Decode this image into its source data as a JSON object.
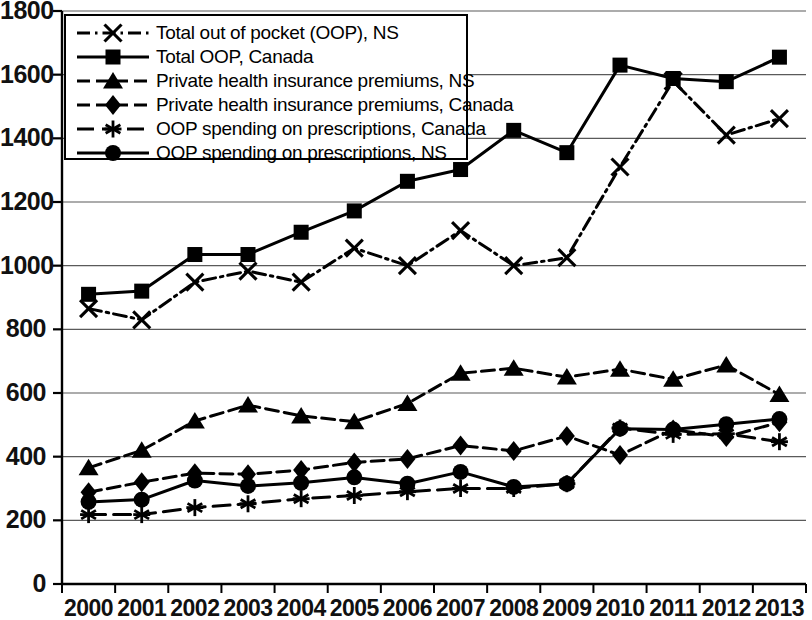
{
  "chart_data": {
    "type": "line",
    "title": "",
    "xlabel": "",
    "ylabel": "",
    "ylim": [
      0,
      1800
    ],
    "ytick_step": 200,
    "yticks": [
      "0",
      "200",
      "400",
      "600",
      "800",
      "1000",
      "1200",
      "1400",
      "1600",
      "1800"
    ],
    "grid": true,
    "grid_axis": "y",
    "legend_position": "top-left-inside",
    "color": "#000000",
    "categories": [
      "2000",
      "2001",
      "2002",
      "2003",
      "2004",
      "2005",
      "2006",
      "2007",
      "2008",
      "2009",
      "2010",
      "2011",
      "2012",
      "2013"
    ],
    "series": [
      {
        "name": "Total out of pocket (OOP), NS",
        "marker": "x",
        "linestyle": "dash-dot",
        "values": [
          865,
          830,
          948,
          983,
          948,
          1055,
          1000,
          1110,
          1000,
          1025,
          1310,
          1580,
          1410,
          1462
        ]
      },
      {
        "name": "Total OOP, Canada",
        "marker": "square",
        "linestyle": "solid",
        "values": [
          910,
          920,
          1035,
          1035,
          1105,
          1172,
          1265,
          1302,
          1425,
          1355,
          1630,
          1588,
          1578,
          1655
        ]
      },
      {
        "name": "Private health insurance premiums, NS",
        "marker": "triangle",
        "linestyle": "dashed",
        "values": [
          365,
          420,
          512,
          562,
          528,
          510,
          567,
          662,
          678,
          650,
          675,
          643,
          688,
          595
        ]
      },
      {
        "name": "Private health insurance premiums, Canada",
        "marker": "diamond",
        "linestyle": "dashed",
        "values": [
          288,
          320,
          348,
          345,
          358,
          382,
          393,
          435,
          418,
          465,
          405,
          485,
          462,
          508
        ]
      },
      {
        "name": "OOP spending on prescriptions, Canada",
        "marker": "asterisk",
        "linestyle": "long-dash",
        "values": [
          218,
          218,
          240,
          252,
          268,
          278,
          290,
          300,
          300,
          315,
          490,
          470,
          472,
          447
        ]
      },
      {
        "name": "OOP spending on prescriptions, NS",
        "marker": "circle",
        "linestyle": "solid",
        "values": [
          258,
          265,
          325,
          308,
          318,
          335,
          315,
          352,
          305,
          315,
          488,
          485,
          502,
          518
        ]
      }
    ]
  },
  "legend": {
    "entries": [
      "Total out of pocket (OOP), NS",
      "Total OOP, Canada",
      "Private health insurance premiums, NS",
      "Private health insurance premiums, Canada",
      "OOP spending on prescriptions, Canada",
      "OOP spending on prescriptions, NS"
    ]
  }
}
